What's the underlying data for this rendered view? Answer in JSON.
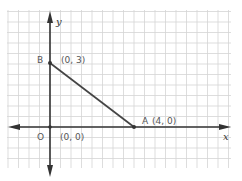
{
  "diagram": {
    "type": "coordinate-plane",
    "axes": {
      "x_label": "x",
      "y_label": "y"
    },
    "points": [
      {
        "name": "B",
        "coord_label": "(0, 3)",
        "x": 0,
        "y": 3
      },
      {
        "name": "A",
        "coord_label": "(4, 0)",
        "x": 4,
        "y": 0
      },
      {
        "name": "O",
        "coord_label": "(0, 0)",
        "x": 0,
        "y": 0
      }
    ],
    "segments": [
      {
        "from": "B",
        "to": "A"
      }
    ],
    "colors": {
      "grid": "#d4d4d4",
      "axis": "#333333",
      "segment": "#444444",
      "label": "#555555"
    }
  }
}
